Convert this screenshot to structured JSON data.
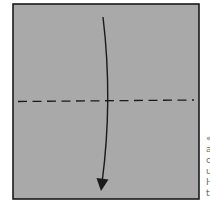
{
  "diagram": {
    "paper": {
      "fill": "#a9a9a9",
      "stroke": "#1a1a1a",
      "x": 13,
      "y": 4,
      "width": 186,
      "height": 195
    },
    "fold_line": {
      "type": "valley-fold",
      "style": "dashed",
      "y": 101,
      "color": "#1a1a1a"
    },
    "arrow": {
      "direction": "down",
      "meaning": "fold top edge down",
      "color": "#1a1a1a"
    }
  },
  "side_text": {
    "lines": [
      "«",
      "a",
      "c",
      "u",
      "H",
      "t"
    ]
  }
}
